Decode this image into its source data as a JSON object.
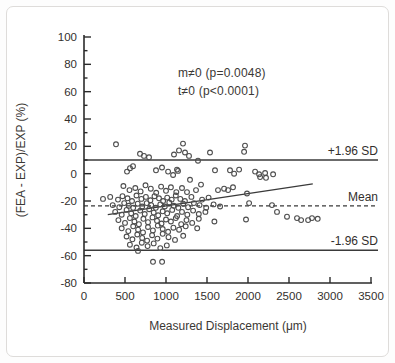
{
  "figure": {
    "background": "#ffffff",
    "border_color": "#dedcda"
  },
  "chart_data": {
    "type": "scatter",
    "title": "",
    "xlabel": "Measured Displacement (μm)",
    "ylabel": "(FEA - EXP)/EXP (%)",
    "xlim": [
      0,
      3500
    ],
    "ylim": [
      -80,
      100
    ],
    "xticks": [
      0,
      500,
      1000,
      1500,
      2000,
      2500,
      3000,
      3500
    ],
    "yticks_major": [
      -80,
      -60,
      -40,
      -20,
      0,
      20,
      40,
      60,
      80,
      100
    ],
    "ytick_minor_step": 10,
    "grid": false,
    "legend": "none",
    "annotation": {
      "line1": "m≠0 (p=0.0048)",
      "line2": "t≠0 (p<0.0001)"
    },
    "reference_lines": [
      {
        "label": "+1.96 SD",
        "value": 10,
        "style": "solid"
      },
      {
        "label": "Mean",
        "value": -23.5,
        "style": "dashed"
      },
      {
        "label": "-1.96 SD",
        "value": -56,
        "style": "solid"
      }
    ],
    "regression_line": {
      "x1": 290,
      "y1": -30,
      "x2": 2790,
      "y2": -7.5
    },
    "marker": {
      "shape": "open-circle",
      "radius_px": 2.4,
      "color": "#4d4d4d"
    },
    "colors": {
      "axis": "#2b2b2b",
      "refline": "#3a3a3a",
      "text": "#332f2d"
    },
    "points": [
      [
        390,
        21.5
      ],
      [
        1207,
        22
      ],
      [
        1964,
        20.5
      ],
      [
        1952,
        16
      ],
      [
        683,
        14.5
      ],
      [
        732,
        13
      ],
      [
        793,
        12
      ],
      [
        1098,
        14
      ],
      [
        1159,
        17
      ],
      [
        1232,
        15.5
      ],
      [
        1281,
        13
      ],
      [
        1537,
        15.5
      ],
      [
        1390,
        9.5
      ],
      [
        524,
        1.5
      ],
      [
        561,
        4
      ],
      [
        598,
        5.5
      ],
      [
        878,
        2.5
      ],
      [
        951,
        4.5
      ],
      [
        1025,
        1.5
      ],
      [
        1086,
        -1
      ],
      [
        1134,
        3
      ],
      [
        1146,
        2
      ],
      [
        1598,
        2.5
      ],
      [
        1781,
        2.5
      ],
      [
        1830,
        0
      ],
      [
        1891,
        3
      ],
      [
        2086,
        1.5
      ],
      [
        2135,
        -0.5
      ],
      [
        2208,
        0.5
      ],
      [
        2147,
        -2.5
      ],
      [
        2220,
        -3
      ],
      [
        2306,
        -0.5
      ],
      [
        1293,
        -4.5
      ],
      [
        1427,
        -8
      ],
      [
        1195,
        -10.5
      ],
      [
        1256,
        -13.5
      ],
      [
        1366,
        -12
      ],
      [
        1634,
        -12
      ],
      [
        1708,
        -11
      ],
      [
        1757,
        -12
      ],
      [
        1817,
        -10
      ],
      [
        1988,
        -14.5
      ],
      [
        2013,
        -21.5
      ],
      [
        2293,
        -23
      ],
      [
        2354,
        -28
      ],
      [
        2476,
        -31.5
      ],
      [
        2647,
        -34
      ],
      [
        2781,
        -32.5
      ],
      [
        1976,
        -33.5
      ],
      [
        2598,
        -32.5
      ],
      [
        2733,
        -34
      ],
      [
        2850,
        -33
      ],
      [
        842,
        -64.5
      ],
      [
        952,
        -64.5
      ],
      [
        659,
        -56.5
      ],
      [
        480,
        -9
      ],
      [
        555,
        -12
      ],
      [
        625,
        -10.5
      ],
      [
        690,
        -13
      ],
      [
        750,
        -8.5
      ],
      [
        815,
        -11
      ],
      [
        880,
        -14
      ],
      [
        940,
        -9.5
      ],
      [
        1000,
        -12.5
      ],
      [
        1060,
        -10
      ],
      [
        1125,
        -13.5
      ],
      [
        232,
        -18.5
      ],
      [
        320,
        -17
      ],
      [
        415,
        -19
      ],
      [
        470,
        -16.5
      ],
      [
        530,
        -18
      ],
      [
        585,
        -20
      ],
      [
        640,
        -16
      ],
      [
        700,
        -18.5
      ],
      [
        755,
        -17
      ],
      [
        810,
        -19.5
      ],
      [
        860,
        -16.5
      ],
      [
        915,
        -18
      ],
      [
        965,
        -20
      ],
      [
        1015,
        -17.5
      ],
      [
        1070,
        -19
      ],
      [
        1120,
        -16
      ],
      [
        1175,
        -18.5
      ],
      [
        1230,
        -20
      ],
      [
        1310,
        -17
      ],
      [
        1440,
        -19
      ],
      [
        1520,
        -17.5
      ],
      [
        350,
        -23
      ],
      [
        430,
        -24.5
      ],
      [
        490,
        -21.5
      ],
      [
        545,
        -23.5
      ],
      [
        600,
        -25
      ],
      [
        655,
        -22
      ],
      [
        710,
        -24
      ],
      [
        765,
        -21.5
      ],
      [
        820,
        -23
      ],
      [
        875,
        -25
      ],
      [
        930,
        -22.5
      ],
      [
        985,
        -24
      ],
      [
        1040,
        -21
      ],
      [
        1095,
        -23.5
      ],
      [
        1150,
        -25
      ],
      [
        1210,
        -22
      ],
      [
        1270,
        -24.5
      ],
      [
        1340,
        -21.5
      ],
      [
        1410,
        -23
      ],
      [
        1490,
        -25
      ],
      [
        1580,
        -22.5
      ],
      [
        1660,
        -24
      ],
      [
        380,
        -28
      ],
      [
        460,
        -30
      ],
      [
        520,
        -26.5
      ],
      [
        575,
        -29
      ],
      [
        630,
        -31
      ],
      [
        685,
        -27
      ],
      [
        740,
        -29.5
      ],
      [
        795,
        -26
      ],
      [
        850,
        -28.5
      ],
      [
        905,
        -30.5
      ],
      [
        960,
        -27.5
      ],
      [
        1015,
        -29
      ],
      [
        1075,
        -26.5
      ],
      [
        1135,
        -31
      ],
      [
        1195,
        -28
      ],
      [
        1260,
        -30
      ],
      [
        1330,
        -27
      ],
      [
        1400,
        -29.5
      ],
      [
        1480,
        -28
      ],
      [
        420,
        -34
      ],
      [
        500,
        -36
      ],
      [
        560,
        -32.5
      ],
      [
        615,
        -35
      ],
      [
        670,
        -37
      ],
      [
        725,
        -33
      ],
      [
        780,
        -35.5
      ],
      [
        835,
        -32
      ],
      [
        890,
        -34.5
      ],
      [
        945,
        -36.5
      ],
      [
        1000,
        -33.5
      ],
      [
        1060,
        -35
      ],
      [
        1120,
        -32.5
      ],
      [
        1185,
        -37
      ],
      [
        1250,
        -34
      ],
      [
        1320,
        -36
      ],
      [
        1400,
        -33
      ],
      [
        1590,
        -35
      ],
      [
        460,
        -40
      ],
      [
        540,
        -42
      ],
      [
        600,
        -38.5
      ],
      [
        660,
        -41
      ],
      [
        720,
        -43
      ],
      [
        780,
        -39
      ],
      [
        840,
        -41.5
      ],
      [
        900,
        -38
      ],
      [
        960,
        -40.5
      ],
      [
        1025,
        -42.5
      ],
      [
        1090,
        -39.5
      ],
      [
        1160,
        -41
      ],
      [
        1240,
        -38.5
      ],
      [
        1380,
        -40
      ],
      [
        520,
        -46
      ],
      [
        590,
        -48
      ],
      [
        650,
        -44.5
      ],
      [
        710,
        -47
      ],
      [
        770,
        -49
      ],
      [
        830,
        -45
      ],
      [
        895,
        -47.5
      ],
      [
        960,
        -44
      ],
      [
        1030,
        -46.5
      ],
      [
        1110,
        -48.5
      ],
      [
        1210,
        -45.5
      ],
      [
        560,
        -52
      ],
      [
        640,
        -54
      ],
      [
        705,
        -50.5
      ],
      [
        775,
        -53
      ],
      [
        850,
        -51
      ],
      [
        930,
        -54.5
      ],
      [
        1010,
        -52.5
      ]
    ]
  }
}
